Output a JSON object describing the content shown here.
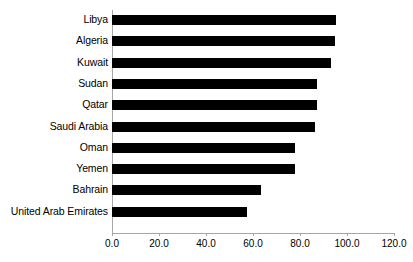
{
  "chart_data": {
    "type": "bar",
    "orientation": "horizontal",
    "title": "",
    "xlabel": "",
    "ylabel": "",
    "xlim": [
      0,
      120
    ],
    "xticks": [
      "0.0",
      "20.0",
      "40.0",
      "60.0",
      "80.0",
      "100.0",
      "120.0"
    ],
    "xtick_values": [
      0,
      20,
      40,
      60,
      80,
      100,
      120
    ],
    "grid": false,
    "legend": null,
    "bar_color": "#000000",
    "axis_color": "#A6A6A6",
    "categories": [
      "Libya",
      "Algeria",
      "Kuwait",
      "Sudan",
      "Qatar",
      "Saudi Arabia",
      "Oman",
      "Yemen",
      "Bahrain",
      "United Arab Emirates"
    ],
    "values": [
      95.5,
      95.0,
      93.2,
      87.2,
      87.2,
      86.4,
      78.0,
      78.0,
      63.4,
      57.4
    ]
  }
}
